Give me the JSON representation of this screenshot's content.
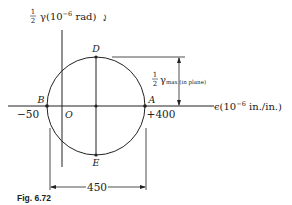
{
  "figure": {
    "caption": "Fig. 6.72",
    "vertical_axis_label": {
      "frac_num": "1",
      "frac_den": "2",
      "text": "γ(10",
      "exp": "−6",
      "unit": " rad)",
      "sign_glyph": "⤸"
    },
    "horizontal_axis_label": {
      "text": "ϵ(10",
      "exp": "−6",
      "unit": " in./in.)"
    },
    "points": {
      "A": "A",
      "B": "B",
      "D": "D",
      "E": "E",
      "O": "O"
    },
    "values": {
      "left": "−50",
      "right": "+400",
      "diameter": "450"
    },
    "gamma_max_label": {
      "frac_num": "1",
      "frac_den": "2",
      "symbol": "γ",
      "subscript": "max (in plane)"
    },
    "colors": {
      "line": "#222222",
      "background": "#ffffff"
    }
  }
}
